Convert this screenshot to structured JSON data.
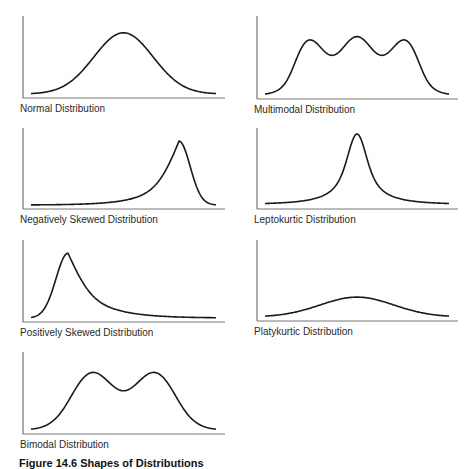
{
  "figure": {
    "caption": "Figure 14.6 Shapes of Distributions"
  },
  "chart_data": [
    {
      "type": "line",
      "title": "Normal Distribution",
      "shape": "normal",
      "modes": 1,
      "skew": "none",
      "kurtosis": "mesokurtic",
      "peak_height": 0.85
    },
    {
      "type": "line",
      "title": "Multimodal Distribution",
      "shape": "multimodal",
      "modes": 3,
      "skew": "none",
      "kurtosis": "mesokurtic",
      "peak_height": 0.8
    },
    {
      "type": "line",
      "title": "Negatively Skewed Distribution",
      "shape": "negatively-skewed",
      "modes": 1,
      "skew": "negative",
      "kurtosis": "mesokurtic",
      "peak_height": 0.9
    },
    {
      "type": "line",
      "title": "Leptokurtic Distribution",
      "shape": "leptokurtic",
      "modes": 1,
      "skew": "none",
      "kurtosis": "leptokurtic",
      "peak_height": 1.0
    },
    {
      "type": "line",
      "title": "Positively Skewed Distribution",
      "shape": "positively-skewed",
      "modes": 1,
      "skew": "positive",
      "kurtosis": "mesokurtic",
      "peak_height": 0.9
    },
    {
      "type": "line",
      "title": "Platykurtic Distribution",
      "shape": "platykurtic",
      "modes": 1,
      "skew": "none",
      "kurtosis": "platykurtic",
      "peak_height": 0.28
    },
    {
      "type": "line",
      "title": "Bimodal Distribution",
      "shape": "bimodal",
      "modes": 2,
      "skew": "none",
      "kurtosis": "mesokurtic",
      "peak_height": 0.8
    }
  ]
}
